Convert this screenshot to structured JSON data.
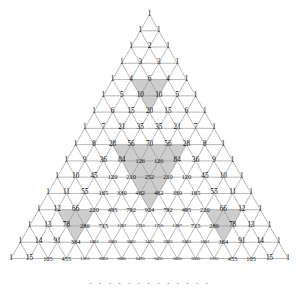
{
  "figure": {
    "name": "pascal-triangle-sierpinski",
    "rows_shown": 16,
    "ellipsis": ". . . . . . . . . . . . .",
    "colors": {
      "background": "#ffffff",
      "line": "#9a9a9a",
      "text": "#111111",
      "shade_light": "#c9c9c9",
      "shade_dark": "#b2b2b2"
    }
  },
  "chart_data": {
    "type": "table",
    "title": "",
    "xlabel": "",
    "ylabel": "",
    "rows": [
      [
        1
      ],
      [
        1,
        1
      ],
      [
        1,
        2,
        1
      ],
      [
        1,
        3,
        3,
        1
      ],
      [
        1,
        4,
        6,
        4,
        1
      ],
      [
        1,
        5,
        10,
        10,
        5,
        1
      ],
      [
        1,
        6,
        15,
        20,
        15,
        6,
        1
      ],
      [
        1,
        7,
        21,
        35,
        35,
        21,
        7,
        1
      ],
      [
        1,
        8,
        28,
        56,
        70,
        56,
        28,
        8,
        1
      ],
      [
        1,
        9,
        36,
        84,
        126,
        126,
        84,
        36,
        9,
        1
      ],
      [
        1,
        10,
        45,
        120,
        210,
        252,
        210,
        120,
        45,
        10,
        1
      ],
      [
        1,
        11,
        55,
        165,
        330,
        462,
        462,
        330,
        165,
        55,
        11,
        1
      ],
      [
        1,
        12,
        66,
        220,
        495,
        792,
        924,
        792,
        495,
        220,
        66,
        12,
        1
      ],
      [
        1,
        13,
        78,
        286,
        715,
        1287,
        1716,
        1716,
        1287,
        715,
        286,
        78,
        13,
        1
      ],
      [
        1,
        14,
        91,
        364,
        1001,
        2002,
        3003,
        3432,
        3003,
        2002,
        1001,
        364,
        91,
        14,
        1
      ],
      [
        1,
        15,
        105,
        455,
        1365,
        3003,
        5005,
        6435,
        6435,
        5005,
        3003,
        1365,
        455,
        105,
        15,
        1
      ]
    ],
    "shaded_triangles": [
      {
        "apex_row": 6,
        "apex_col": 3,
        "size": 2,
        "label": "even-block-rows-4-6"
      },
      {
        "apex_row": 12,
        "apex_col": 6,
        "size": 4,
        "label": "even-block-rows-8-12"
      },
      {
        "apex_row": 14,
        "apex_col": 3,
        "size": 2,
        "label": "even-block-rows-12-14-left"
      },
      {
        "apex_row": 14,
        "apex_col": 11,
        "size": 2,
        "label": "even-block-rows-12-14-right"
      }
    ]
  }
}
